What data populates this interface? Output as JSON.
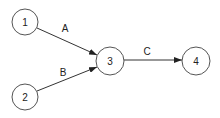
{
  "diagram": {
    "type": "directed-graph",
    "nodes": [
      {
        "id": "1",
        "label": "1",
        "cx": 25,
        "cy": 22,
        "r": 13
      },
      {
        "id": "2",
        "label": "2",
        "cx": 25,
        "cy": 97,
        "r": 13
      },
      {
        "id": "3",
        "label": "3",
        "cx": 110,
        "cy": 61,
        "r": 14
      },
      {
        "id": "4",
        "label": "4",
        "cx": 196,
        "cy": 61,
        "r": 14
      }
    ],
    "edges": [
      {
        "id": "A",
        "label": "A",
        "from": "1",
        "to": "3"
      },
      {
        "id": "B",
        "label": "B",
        "from": "2",
        "to": "3"
      },
      {
        "id": "C",
        "label": "C",
        "from": "3",
        "to": "4"
      }
    ],
    "colors": {
      "stroke": "#555555",
      "edge": "#333333",
      "text": "#222222",
      "background": "#ffffff"
    }
  }
}
